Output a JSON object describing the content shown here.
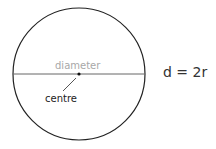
{
  "diagram": {
    "labels": {
      "diameter": "diameter",
      "centre": "centre",
      "formula": "d = 2r"
    },
    "colors": {
      "circle": "#222222",
      "diameter_line": "#666666",
      "diameter_label": "#a8a8a8",
      "text": "#222222"
    }
  }
}
